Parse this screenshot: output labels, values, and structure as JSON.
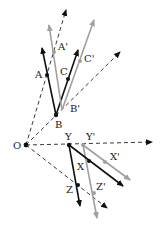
{
  "diagram": {
    "colors": {
      "original": "#111111",
      "transformed": "#a0a0a0",
      "dashed": "#222222",
      "background": "#ffffff"
    },
    "origin": {
      "label": "O",
      "x": 26,
      "y": 145
    },
    "labels": {
      "O": "O",
      "A": "A",
      "A_prime": "A'",
      "B": "B",
      "B_prime": "B'",
      "C": "C",
      "C_prime": "C'",
      "Y": "Y",
      "Y_prime": "Y'",
      "X": "X",
      "X_prime": "X'",
      "Z": "Z",
      "Z_prime": "Z'"
    },
    "points": {
      "O": [
        26,
        145
      ],
      "A": [
        47,
        75
      ],
      "A_prime": [
        54,
        52
      ],
      "B": [
        56,
        115
      ],
      "C": [
        68,
        78
      ],
      "C_prime": [
        80,
        60
      ],
      "Y": [
        69,
        145
      ],
      "Y_prime": [
        83,
        145
      ],
      "X": [
        89,
        161
      ],
      "X_prime": [
        105,
        161
      ],
      "Z": [
        78,
        185
      ],
      "Z_prime": [
        95,
        193
      ]
    }
  }
}
